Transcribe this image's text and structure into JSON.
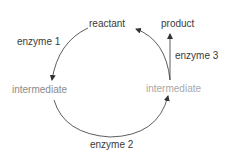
{
  "diagram": {
    "type": "enzyme-pathway-cycle",
    "nodes": {
      "reactant": "reactant",
      "product": "product",
      "intermediate_left": "intermediate",
      "intermediate_right": "intermediate"
    },
    "edges": {
      "enzyme1": "enzyme 1",
      "enzyme2": "enzyme 2",
      "enzyme3": "enzyme 3"
    },
    "colors": {
      "line": "#333333",
      "text_dark": "#3a3a3a",
      "text_intermediate_left": "#8a8a8a",
      "text_intermediate_right": "#a8a8a8"
    }
  }
}
